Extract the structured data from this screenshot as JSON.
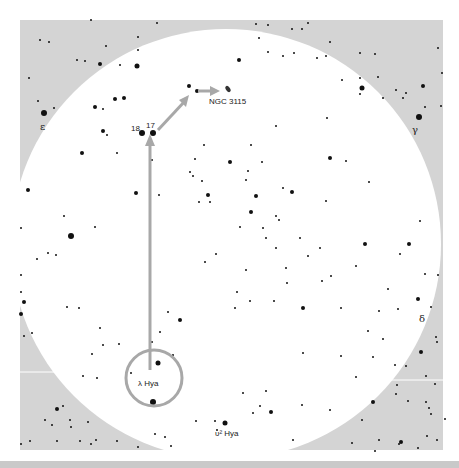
{
  "map": {
    "title": "Finder chart: lambda Hydrae to NGC 3115",
    "colors": {
      "sky_background": "#d4d4d4",
      "field_of_view": "#ffffff",
      "star": "#111111",
      "pointer": "#a8a8a8",
      "label": "#222222"
    },
    "labels": {
      "target": "NGC 3115",
      "star_17": "17",
      "star_18": "18",
      "lambda": "λ Hya",
      "upsilon2": "υ² Hya",
      "epsilon": "ε",
      "gamma": "γ",
      "delta": "δ"
    },
    "route": [
      "λ Hya",
      "17",
      "NGC 3115"
    ]
  }
}
